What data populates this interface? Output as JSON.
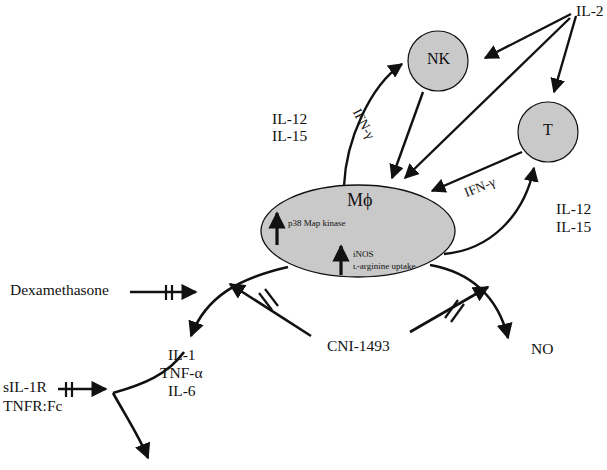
{
  "figure": {
    "type": "biological-signaling-pathway",
    "background_color": "#ffffff",
    "cell_fill_color": "#c9c9c9",
    "stroke_color": "#111111"
  },
  "cells": {
    "nk": {
      "label": "NK",
      "shape": "circle"
    },
    "t": {
      "label": "T",
      "shape": "circle"
    },
    "macrophage": {
      "label": "Mϕ",
      "shape": "ellipse"
    }
  },
  "macrophage_contents": {
    "upregulated": [
      {
        "arrow": "up-arrow",
        "label": "p38 Map kinase"
      },
      {
        "arrow": "up-arrow",
        "label_line1": "iNOS",
        "label_line2": "ʟ-arginine uptake"
      }
    ]
  },
  "cytokines": {
    "il2": "IL-2",
    "ifn_gamma_nk": "IFN-γ",
    "ifn_gamma_t": "IFN-γ",
    "il12_il15_left_line1": "IL-12",
    "il12_il15_left_line2": "IL-15",
    "il12_il15_right_line1": "IL-12",
    "il12_il15_right_line2": "IL-15"
  },
  "outputs": {
    "no": "NO",
    "mediators_line1": "IL-1",
    "mediators_line2": "TNF-α",
    "mediators_line3": "IL-6"
  },
  "inhibitors": {
    "dexamethasone": "Dexamethasone",
    "cni1493": "CNI-1493",
    "sil1r_line1": "sIL-1R",
    "sil1r_line2": "TNFR:Fc"
  }
}
